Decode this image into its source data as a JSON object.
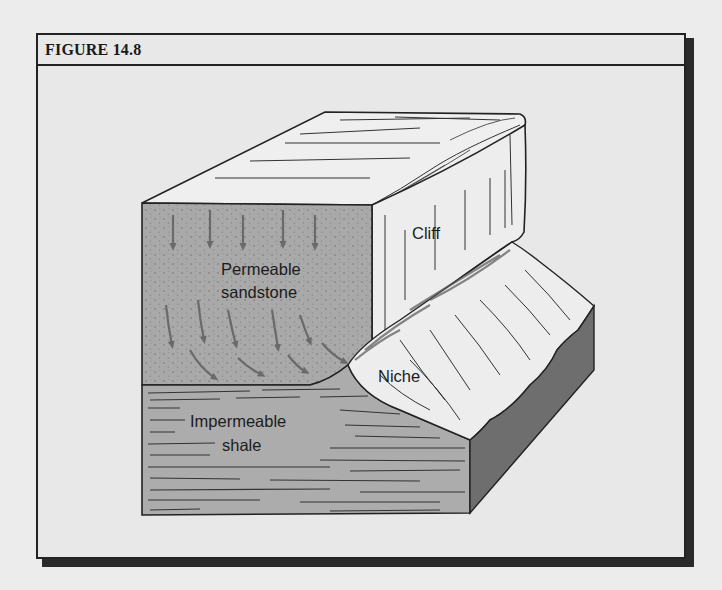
{
  "figure": {
    "title": "FIGURE 14.8"
  },
  "labels": {
    "cliff": "Cliff",
    "sandstone_line1": "Permeable",
    "sandstone_line2": "sandstone",
    "shale_line1": "Impermeable",
    "shale_line2": "shale",
    "niche": "Niche"
  },
  "layers": [
    {
      "name": "Permeable sandstone",
      "fill": "#a9a9a9"
    },
    {
      "name": "Impermeable shale",
      "fill": "#acacac"
    },
    {
      "name": "Cliff face",
      "fill": "#ededed"
    },
    {
      "name": "Block side",
      "fill": "#6e6e6e"
    }
  ],
  "arrows": {
    "description": "Groundwater flow arrows: straight down at top of sandstone, curving toward the niche near the shale contact",
    "color": "#6a6a6a"
  }
}
